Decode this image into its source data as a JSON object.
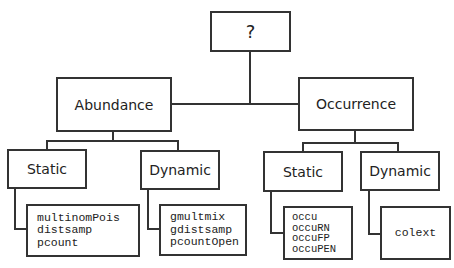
{
  "diagram": {
    "root": {
      "label": "?"
    },
    "branches": [
      {
        "label": "Abundance",
        "children": [
          {
            "label": "Static",
            "methods": [
              "multinomPois",
              "distsamp",
              "pcount"
            ]
          },
          {
            "label": "Dynamic",
            "methods": [
              "gmultmix",
              "gdistsamp",
              "pcountOpen"
            ]
          }
        ]
      },
      {
        "label": "Occurrence",
        "children": [
          {
            "label": "Static",
            "methods": [
              "occu",
              "occuRN",
              "occuFP",
              "occuPEN"
            ]
          },
          {
            "label": "Dynamic",
            "methods": [
              "colext"
            ]
          }
        ]
      }
    ]
  },
  "colors": {
    "line": "#333333",
    "text": "#222222",
    "background": "#ffffff"
  }
}
